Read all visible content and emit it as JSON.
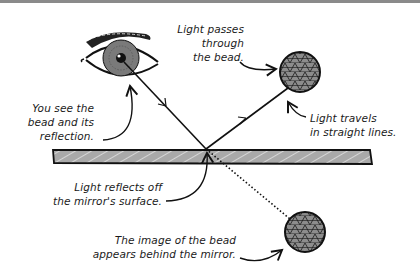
{
  "diagram": {
    "colors": {
      "ink": "#111111",
      "mirror_fill": "#a9a9a9",
      "bead_fill": "#8c8c8c",
      "iris": "#7a7a7a",
      "topbar": "#8a8a8a"
    },
    "nodes": [
      {
        "id": "eye",
        "label": "Eye"
      },
      {
        "id": "bead",
        "label": "Bead"
      },
      {
        "id": "mirror",
        "label": "Mirror"
      },
      {
        "id": "bead-image",
        "label": "Image of the bead"
      }
    ],
    "labels": {
      "light_passes": [
        "Light passes",
        "through",
        "the bead."
      ],
      "you_see": [
        "You see the",
        "bead and its",
        "reflection."
      ],
      "light_travels": [
        "Light travels",
        "in straight lines."
      ],
      "light_reflects": [
        "Light reflects off",
        "the mirror's surface."
      ],
      "image_behind": [
        "The image of the bead",
        "appears behind the mirror."
      ]
    },
    "edges": [
      {
        "from": "bead",
        "to": "mirror",
        "style": "solid-arrow"
      },
      {
        "from": "mirror",
        "to": "eye",
        "style": "solid-arrow"
      },
      {
        "from": "mirror",
        "to": "bead-image",
        "style": "dotted"
      }
    ]
  }
}
